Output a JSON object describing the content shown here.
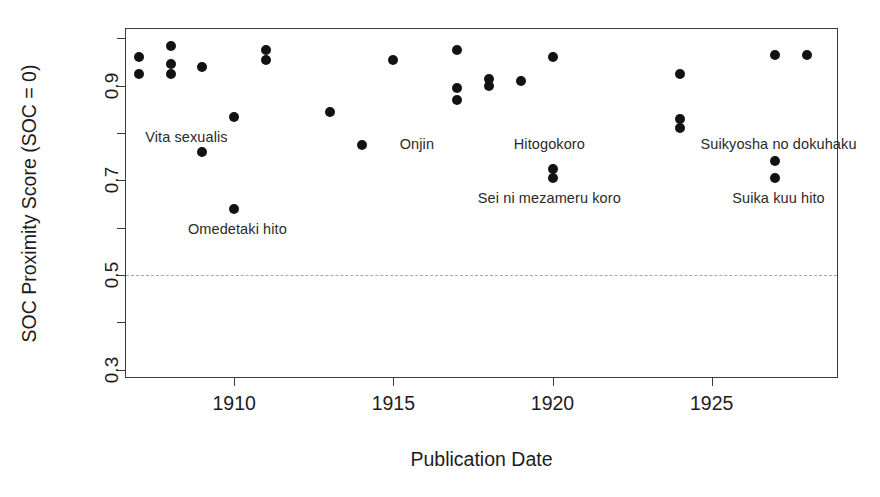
{
  "chart_data": {
    "type": "scatter",
    "title": "",
    "xlabel": "Publication Date",
    "ylabel": "SOC Proximity Score (SOC = 0)",
    "xlim": [
      1906.6,
      1929.0
    ],
    "ylim": [
      0.28,
      1.02
    ],
    "grid": false,
    "legend": null,
    "x_ticks": [
      {
        "value": 1910,
        "label": "1910"
      },
      {
        "value": 1915,
        "label": "1915"
      },
      {
        "value": 1920,
        "label": "1920"
      },
      {
        "value": 1925,
        "label": "1925"
      }
    ],
    "y_ticks": [
      {
        "value": 0.3,
        "label": "0.3"
      },
      {
        "value": 0.4,
        "label": ""
      },
      {
        "value": 0.5,
        "label": "0.5"
      },
      {
        "value": 0.6,
        "label": ""
      },
      {
        "value": 0.7,
        "label": "0.7"
      },
      {
        "value": 0.8,
        "label": ""
      },
      {
        "value": 0.9,
        "label": "0.9"
      },
      {
        "value": 1.0,
        "label": ""
      }
    ],
    "threshold_line": {
      "value": 0.5,
      "style": "dashed",
      "color": "#a8a8a8"
    },
    "marker": {
      "shape": "circle",
      "color": "#121212",
      "size_px": 10
    },
    "points": [
      {
        "x": 1907.0,
        "y": 0.96
      },
      {
        "x": 1907.0,
        "y": 0.925
      },
      {
        "x": 1908.0,
        "y": 0.985
      },
      {
        "x": 1908.0,
        "y": 0.945
      },
      {
        "x": 1908.0,
        "y": 0.925
      },
      {
        "x": 1909.0,
        "y": 0.94
      },
      {
        "x": 1909.0,
        "y": 0.76,
        "label": "Vita sexualis"
      },
      {
        "x": 1910.0,
        "y": 0.835
      },
      {
        "x": 1910.0,
        "y": 0.64,
        "label": "Omedetaki hito"
      },
      {
        "x": 1911.0,
        "y": 0.975
      },
      {
        "x": 1911.0,
        "y": 0.955
      },
      {
        "x": 1913.0,
        "y": 0.845
      },
      {
        "x": 1914.0,
        "y": 0.775,
        "label": "Onjin"
      },
      {
        "x": 1915.0,
        "y": 0.955
      },
      {
        "x": 1917.0,
        "y": 0.975
      },
      {
        "x": 1917.0,
        "y": 0.895
      },
      {
        "x": 1917.0,
        "y": 0.87
      },
      {
        "x": 1918.0,
        "y": 0.915
      },
      {
        "x": 1918.0,
        "y": 0.9
      },
      {
        "x": 1919.0,
        "y": 0.91
      },
      {
        "x": 1920.0,
        "y": 0.96
      },
      {
        "x": 1920.0,
        "y": 0.725,
        "label": "Hitogokoro"
      },
      {
        "x": 1920.0,
        "y": 0.705,
        "label": "Sei ni mezameru koro"
      },
      {
        "x": 1924.0,
        "y": 0.925
      },
      {
        "x": 1924.0,
        "y": 0.83
      },
      {
        "x": 1924.0,
        "y": 0.81
      },
      {
        "x": 1927.0,
        "y": 0.965
      },
      {
        "x": 1927.0,
        "y": 0.74,
        "label": "Suikyosha no dokuhaku"
      },
      {
        "x": 1927.0,
        "y": 0.705,
        "label": "Suika kuu hito"
      },
      {
        "x": 1928.0,
        "y": 0.965
      }
    ],
    "annotations": [
      {
        "text": "Vita sexualis",
        "x": 1908.5,
        "y": 0.79,
        "anchor": "center"
      },
      {
        "text": "Omedetaki hito",
        "x": 1910.1,
        "y": 0.595,
        "anchor": "center"
      },
      {
        "text": "Onjin",
        "x": 1915.2,
        "y": 0.775,
        "anchor": "left"
      },
      {
        "text": "Hitogokoro",
        "x": 1919.9,
        "y": 0.775,
        "anchor": "center"
      },
      {
        "text": "Sei ni mezameru koro",
        "x": 1919.9,
        "y": 0.66,
        "anchor": "center"
      },
      {
        "text": "Suikyosha no dokuhaku",
        "x": 1927.1,
        "y": 0.775,
        "anchor": "center"
      },
      {
        "text": "Suika kuu hito",
        "x": 1927.1,
        "y": 0.66,
        "anchor": "center"
      }
    ]
  }
}
